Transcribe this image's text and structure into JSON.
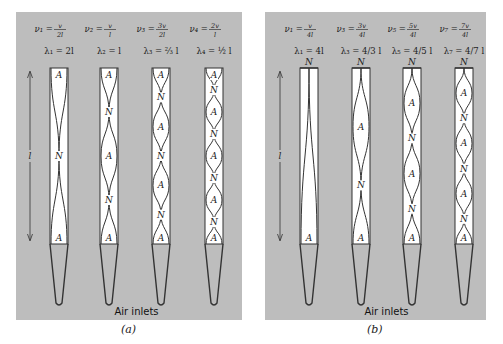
{
  "panels": [
    {
      "id": "a",
      "caption": "(a)",
      "inlet_label": "Air inlets",
      "length_label": "l",
      "tube_type": "open-open",
      "modes": [
        {
          "freq": "ν₁ =",
          "freq_num": "v",
          "freq_den": "2l",
          "wl": "λ₁ = 2l",
          "top": "A",
          "nodes": [
            "A",
            "N",
            "A"
          ]
        },
        {
          "freq": "ν₂ =",
          "freq_num": "v",
          "freq_den": "l",
          "wl": "λ₂ = l",
          "top": "A",
          "nodes": [
            "A",
            "N",
            "A",
            "N",
            "A"
          ]
        },
        {
          "freq": "ν₃ =",
          "freq_num": "3v",
          "freq_den": "2l",
          "wl": "λ₃ = ⅔ l",
          "top": "A",
          "nodes": [
            "A",
            "N",
            "A",
            "N",
            "A",
            "N",
            "A"
          ]
        },
        {
          "freq": "ν₄ =",
          "freq_num": "2v",
          "freq_den": "l",
          "wl": "λ₄ = ½ l",
          "top": "A",
          "nodes": [
            "A",
            "N",
            "A",
            "N",
            "A",
            "N",
            "A",
            "N",
            "A"
          ]
        }
      ]
    },
    {
      "id": "b",
      "caption": "(b)",
      "inlet_label": "Air inlets",
      "length_label": "l",
      "tube_type": "closed-open",
      "modes": [
        {
          "freq": "ν₁ =",
          "freq_num": "v",
          "freq_den": "4l",
          "wl": "λ₁ = 4l",
          "top": "N",
          "nodes": [
            "N",
            "A"
          ]
        },
        {
          "freq": "ν₃ =",
          "freq_num": "3v",
          "freq_den": "4l",
          "wl": "λ₃ = 4/3 l",
          "top": "N",
          "nodes": [
            "N",
            "A",
            "N",
            "A"
          ]
        },
        {
          "freq": "ν₅ =",
          "freq_num": "5v",
          "freq_den": "4l",
          "wl": "λ₅ = 4/5 l",
          "top": "N",
          "nodes": [
            "N",
            "A",
            "N",
            "A",
            "N",
            "A"
          ]
        },
        {
          "freq": "ν₇ =",
          "freq_num": "7v",
          "freq_den": "4l",
          "wl": "λ₇ = 4/7 l",
          "top": "N",
          "nodes": [
            "N",
            "A",
            "N",
            "A",
            "N",
            "A",
            "N",
            "A"
          ]
        }
      ]
    }
  ],
  "colors": {
    "panel_bg": "#bdbdbd",
    "tube_fill": "#ffffff",
    "line": "#333333"
  }
}
